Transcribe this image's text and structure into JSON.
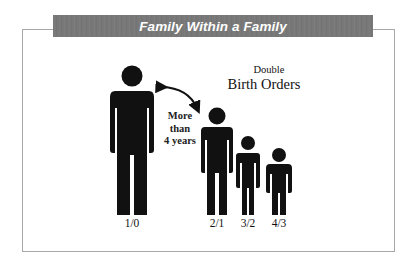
{
  "title": "Family Within a Family",
  "heading": {
    "line1": "Double",
    "line2": "Birth Orders"
  },
  "gap_annotation": {
    "line1": "More",
    "line2": "than",
    "line3": "4 years"
  },
  "figures": [
    {
      "label": "1/0",
      "size": "adult"
    },
    {
      "label": "2/1",
      "size": "large-child"
    },
    {
      "label": "3/2",
      "size": "medium-child"
    },
    {
      "label": "4/3",
      "size": "small-child"
    }
  ],
  "icons": {
    "arrow": "curved-double-arrow",
    "person": "person-silhouette"
  },
  "colors": {
    "title_bar": "#7a7a7a",
    "title_text": "#ffffff",
    "frame": "#a8a8a8",
    "figure": "#111111"
  }
}
